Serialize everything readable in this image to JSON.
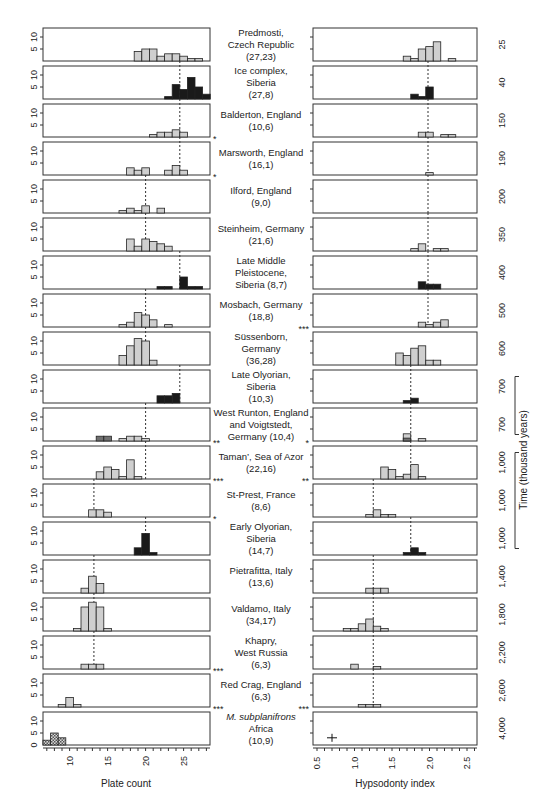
{
  "chart_data": {
    "type": "bar",
    "title": "",
    "layout": "paired histogram panels per site, ordered by time",
    "left_panel": {
      "xlabel": "Plate count",
      "xticks": [
        10,
        15,
        20,
        25
      ],
      "xlim": [
        6.5,
        28
      ],
      "ylabel_ticks": [
        "5",
        "10"
      ],
      "bottom_row_yticks": [
        "0",
        "5",
        "10"
      ],
      "bin_width": 1
    },
    "right_panel": {
      "xlabel": "Hypsodonty index",
      "xticks": [
        "0.5",
        "1.0",
        "1.5",
        "2.0",
        "2.5"
      ],
      "xlim": [
        0.45,
        2.65
      ],
      "bin_width": 0.1
    },
    "time_axis": {
      "label": "Time (thousand years)",
      "brackets": [
        [
          "700",
          "700"
        ],
        [
          "1,000",
          "1,000",
          "1,000"
        ]
      ]
    },
    "rows": [
      {
        "site": [
          "Predmosti,",
          "Czech Republic",
          "(27,23)"
        ],
        "time": "25",
        "fill": "light",
        "left_sig": "",
        "right_sig": "",
        "plate": [
          [
            19,
            4
          ],
          [
            20,
            5
          ],
          [
            21,
            5
          ],
          [
            22,
            2
          ],
          [
            23,
            3
          ],
          [
            24,
            3
          ],
          [
            25,
            2
          ],
          [
            26,
            1
          ],
          [
            27,
            1
          ]
        ],
        "hyps": [
          [
            1.7,
            2
          ],
          [
            1.8,
            1
          ],
          [
            1.9,
            5
          ],
          [
            2.0,
            6
          ],
          [
            2.1,
            8
          ],
          [
            2.3,
            1
          ]
        ],
        "plate_mean": null,
        "hyps_mean": null
      },
      {
        "site": [
          "Ice complex,",
          "Siberia",
          "(27,8)"
        ],
        "time": "40",
        "fill": "dark",
        "left_sig": "",
        "right_sig": "",
        "plate": [
          [
            23,
            1
          ],
          [
            24,
            6
          ],
          [
            25,
            4
          ],
          [
            26,
            9
          ],
          [
            27,
            5
          ],
          [
            28,
            2
          ]
        ],
        "hyps": [
          [
            1.8,
            2
          ],
          [
            1.9,
            1
          ],
          [
            2.0,
            5
          ]
        ],
        "plate_mean": 24.5,
        "hyps_mean": 1.98
      },
      {
        "site": [
          "Balderton, England",
          "(10,6)"
        ],
        "time": "150",
        "fill": "light",
        "left_sig": "*",
        "right_sig": "",
        "plate": [
          [
            21,
            1
          ],
          [
            22,
            2
          ],
          [
            23,
            2
          ],
          [
            24,
            3
          ],
          [
            25,
            2
          ]
        ],
        "hyps": [
          [
            1.9,
            2
          ],
          [
            2.0,
            2
          ],
          [
            2.2,
            1
          ],
          [
            2.3,
            1
          ]
        ],
        "plate_mean": 24.5,
        "hyps_mean": 1.98
      },
      {
        "site": [
          "Marsworth, England",
          "(16,1)"
        ],
        "time": "190",
        "fill": "light",
        "left_sig": "*",
        "right_sig": "",
        "plate": [
          [
            18,
            3
          ],
          [
            19,
            2
          ],
          [
            20,
            3
          ],
          [
            23,
            2
          ],
          [
            24,
            4
          ],
          [
            25,
            2
          ]
        ],
        "hyps": [
          [
            2.0,
            1
          ]
        ],
        "plate_mean": 24.5,
        "hyps_mean": 1.98
      },
      {
        "site": [
          "Ilford, England",
          "(9,0)"
        ],
        "time": "200",
        "fill": "light",
        "left_sig": "",
        "right_sig": "",
        "plate": [
          [
            17,
            1
          ],
          [
            18,
            2
          ],
          [
            19,
            1
          ],
          [
            20,
            3
          ],
          [
            22,
            2
          ]
        ],
        "hyps": [],
        "plate_mean": 20,
        "hyps_mean": 1.98
      },
      {
        "site": [
          "Steinheim, Germany",
          "(21,6)"
        ],
        "time": "350",
        "fill": "light",
        "left_sig": "",
        "right_sig": "",
        "plate": [
          [
            18,
            5
          ],
          [
            19,
            2
          ],
          [
            20,
            5
          ],
          [
            21,
            4
          ],
          [
            22,
            3
          ],
          [
            23,
            2
          ]
        ],
        "hyps": [
          [
            1.8,
            1
          ],
          [
            1.9,
            3
          ],
          [
            2.1,
            1
          ],
          [
            2.2,
            1
          ]
        ],
        "plate_mean": 20,
        "hyps_mean": 1.98
      },
      {
        "site": [
          "Late Middle",
          "Pleistocene,",
          "Siberia (8,7)"
        ],
        "time": "400",
        "fill": "dark",
        "left_sig": "",
        "right_sig": "",
        "plate": [
          [
            22,
            1
          ],
          [
            23,
            1
          ],
          [
            25,
            5
          ],
          [
            26,
            1
          ],
          [
            27,
            1
          ]
        ],
        "hyps": [
          [
            1.9,
            3
          ],
          [
            2.0,
            2
          ],
          [
            2.1,
            2
          ]
        ],
        "plate_mean": 24.5,
        "hyps_mean": 1.98
      },
      {
        "site": [
          "Mosbach, Germany",
          "(18,8)"
        ],
        "time": "500",
        "fill": "light",
        "left_sig": "",
        "right_sig": "***",
        "plate": [
          [
            17,
            1
          ],
          [
            18,
            2
          ],
          [
            19,
            6
          ],
          [
            20,
            5
          ],
          [
            21,
            3
          ],
          [
            23,
            1
          ]
        ],
        "hyps": [
          [
            1.9,
            2
          ],
          [
            2.0,
            1
          ],
          [
            2.1,
            2
          ],
          [
            2.2,
            3
          ]
        ],
        "plate_mean": 20,
        "hyps_mean": 1.98
      },
      {
        "site": [
          "Süssenborn,",
          "Germany",
          "(36,28)"
        ],
        "time": "600",
        "fill": "light",
        "left_sig": "",
        "right_sig": "",
        "plate": [
          [
            17,
            4
          ],
          [
            18,
            8
          ],
          [
            19,
            11
          ],
          [
            20,
            10
          ],
          [
            21,
            2
          ]
        ],
        "hyps": [
          [
            1.6,
            5
          ],
          [
            1.7,
            4
          ],
          [
            1.8,
            7
          ],
          [
            1.9,
            8
          ],
          [
            2.0,
            2
          ],
          [
            2.1,
            2
          ]
        ],
        "plate_mean": 20,
        "hyps_mean": null
      },
      {
        "site": [
          "Late Olyorian,",
          "Siberia",
          "(10,3)"
        ],
        "time": "700",
        "fill": "dark",
        "left_sig": "",
        "right_sig": "",
        "plate": [
          [
            22,
            3
          ],
          [
            23,
            3
          ],
          [
            24,
            4
          ]
        ],
        "hyps": [
          [
            1.7,
            1
          ],
          [
            1.8,
            2
          ]
        ],
        "plate_mean": 24.5,
        "hyps_mean": 1.75
      },
      {
        "site": [
          "West Runton, England",
          "and Voigtstedt,",
          "Germany (10,4)"
        ],
        "time": "700",
        "fill": "mixed",
        "left_sig": "**",
        "right_sig": "*",
        "plate": [
          [
            14,
            2
          ],
          [
            15,
            2
          ],
          [
            17,
            1
          ],
          [
            18,
            2
          ],
          [
            19,
            2
          ],
          [
            20,
            1
          ]
        ],
        "hyps": [
          [
            1.7,
            3
          ],
          [
            1.9,
            1
          ]
        ],
        "plate_mean": 20,
        "hyps_mean": 1.75
      },
      {
        "site": [
          "Taman’, Sea of Azor",
          "(22,16)"
        ],
        "time": "1,000",
        "fill": "light",
        "left_sig": "***",
        "right_sig": "**",
        "plate": [
          [
            14,
            3
          ],
          [
            15,
            5
          ],
          [
            16,
            4
          ],
          [
            17,
            1
          ],
          [
            18,
            8
          ],
          [
            19,
            1
          ]
        ],
        "hyps": [
          [
            1.4,
            5
          ],
          [
            1.5,
            4
          ],
          [
            1.6,
            1
          ],
          [
            1.7,
            2
          ],
          [
            1.8,
            6
          ],
          [
            1.9,
            1
          ]
        ],
        "plate_mean": 20,
        "hyps_mean": 1.75
      },
      {
        "site": [
          "St-Prest, France",
          "(8,6)"
        ],
        "time": "1,000",
        "fill": "light",
        "left_sig": "*",
        "right_sig": "",
        "plate": [
          [
            13,
            3
          ],
          [
            14,
            3
          ],
          [
            15,
            2
          ]
        ],
        "hyps": [
          [
            1.2,
            1
          ],
          [
            1.3,
            3
          ],
          [
            1.4,
            1
          ],
          [
            1.5,
            1
          ]
        ],
        "plate_mean": 13.2,
        "hyps_mean": 1.25
      },
      {
        "site": [
          "Early Olyorian,",
          "Siberia",
          "(14,7)"
        ],
        "time": "1,000",
        "fill": "dark",
        "left_sig": "",
        "right_sig": "",
        "plate": [
          [
            19,
            3
          ],
          [
            20,
            9
          ],
          [
            21,
            1
          ]
        ],
        "hyps": [
          [
            1.7,
            1
          ],
          [
            1.8,
            3
          ],
          [
            1.9,
            1
          ]
        ],
        "plate_mean": 20,
        "hyps_mean": 1.75
      },
      {
        "site": [
          "Pietrafitta, Italy",
          "(13,6)"
        ],
        "time": "1,400",
        "fill": "light",
        "left_sig": "",
        "right_sig": "",
        "plate": [
          [
            12,
            2
          ],
          [
            13,
            7
          ],
          [
            14,
            4
          ]
        ],
        "hyps": [
          [
            1.2,
            2
          ],
          [
            1.3,
            2
          ],
          [
            1.4,
            2
          ]
        ],
        "plate_mean": 13.2,
        "hyps_mean": 1.25
      },
      {
        "site": [
          "Valdamo, Italy",
          "(34,17)"
        ],
        "time": "1,800",
        "fill": "light",
        "left_sig": "",
        "right_sig": "",
        "plate": [
          [
            11,
            1
          ],
          [
            12,
            10
          ],
          [
            13,
            12
          ],
          [
            14,
            10
          ],
          [
            15,
            1
          ]
        ],
        "hyps": [
          [
            0.9,
            1
          ],
          [
            1.0,
            1
          ],
          [
            1.1,
            3
          ],
          [
            1.2,
            5
          ],
          [
            1.3,
            2
          ],
          [
            1.4,
            1
          ]
        ],
        "plate_mean": 13.2,
        "hyps_mean": 1.25
      },
      {
        "site": [
          "Khapry,",
          "West Russia",
          "(6,3)"
        ],
        "time": "2,200",
        "fill": "light",
        "left_sig": "***",
        "right_sig": "",
        "plate": [
          [
            12,
            2
          ],
          [
            13,
            2
          ],
          [
            14,
            2
          ]
        ],
        "hyps": [
          [
            1.0,
            2
          ],
          [
            1.3,
            1
          ]
        ],
        "plate_mean": 13.2,
        "hyps_mean": 1.25
      },
      {
        "site": [
          "Red Crag, England",
          "(6,3)"
        ],
        "time": "2,600",
        "fill": "light",
        "left_sig": "***",
        "right_sig": "***",
        "plate": [
          [
            9,
            1
          ],
          [
            10,
            4
          ],
          [
            11,
            1
          ]
        ],
        "hyps": [
          [
            1.1,
            1
          ],
          [
            1.2,
            1
          ],
          [
            1.3,
            1
          ]
        ],
        "plate_mean": null,
        "hyps_mean": 1.25
      },
      {
        "site": [
          "M. subplanifrons",
          "Africa",
          "(10,9)"
        ],
        "time": "4,000",
        "fill": "hatched",
        "left_sig": "",
        "right_sig": "",
        "site_italic_first_line": true,
        "plate": [
          [
            7,
            2
          ],
          [
            8,
            5
          ],
          [
            9,
            3
          ]
        ],
        "hyps": [],
        "hyps_point": {
          "x": 0.7,
          "y": 3
        },
        "plate_mean": null,
        "hyps_mean": null
      }
    ]
  },
  "labels": {
    "left_xlabel": "Plate count",
    "right_xlabel": "Hypsodonty index",
    "time_label": "Time (thousand years)"
  }
}
